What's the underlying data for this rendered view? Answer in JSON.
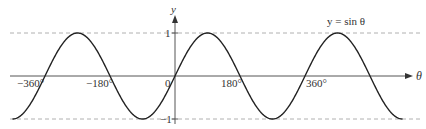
{
  "chart_data": {
    "type": "line",
    "title": "",
    "curve_label": "y = sin θ",
    "xlabel": "θ",
    "ylabel": "y",
    "x_unit": "degrees",
    "xlim": [
      -450,
      630
    ],
    "ylim": [
      -1,
      1
    ],
    "x_ticks": [
      {
        "value": -360,
        "label": "−360°"
      },
      {
        "value": -180,
        "label": "−180°"
      },
      {
        "value": 0,
        "label": "0"
      },
      {
        "value": 180,
        "label": "180°"
      },
      {
        "value": 360,
        "label": "360°"
      }
    ],
    "y_ticks": [
      {
        "value": 1,
        "label": "1"
      },
      {
        "value": -1,
        "label": "−1"
      }
    ],
    "reference_lines": [
      {
        "y": 1,
        "style": "dashed"
      },
      {
        "y": -1,
        "style": "dashed"
      }
    ],
    "series": [
      {
        "name": "y = sin θ",
        "function": "sin",
        "x": [
          -450,
          -360,
          -270,
          -180,
          -90,
          0,
          90,
          180,
          270,
          360,
          450,
          540,
          630
        ],
        "values": [
          -1,
          0,
          1,
          0,
          -1,
          0,
          1,
          0,
          -1,
          0,
          1,
          0,
          -1
        ]
      }
    ],
    "grid": false,
    "legend": "none",
    "colors": {
      "curve": "#222222",
      "axis": "#555555",
      "dashed": "#aaaaaa",
      "text": "#333333"
    }
  }
}
